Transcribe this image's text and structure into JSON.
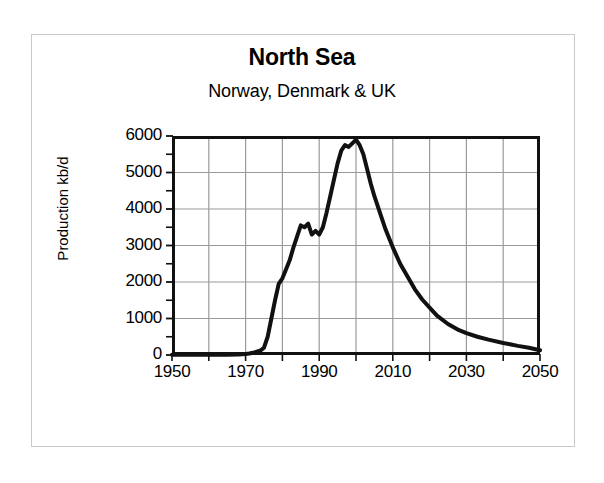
{
  "chart_data": {
    "type": "line",
    "title": "North Sea",
    "subtitle": "Norway, Denmark & UK",
    "xlabel": "",
    "ylabel": "Production kb/d",
    "xlim": [
      1950,
      2050
    ],
    "ylim": [
      0,
      6000
    ],
    "grid": true,
    "legend": null,
    "x_major_ticks": [
      1950,
      1970,
      1990,
      2010,
      2030,
      2050
    ],
    "x_major_tick_labels": [
      "1950",
      "1970",
      "1990",
      "2010",
      "2030",
      "2050"
    ],
    "x_minor_tick_step": 10,
    "y_ticks": [
      0,
      1000,
      2000,
      3000,
      4000,
      5000,
      6000
    ],
    "y_tick_labels": [
      "0",
      "1000",
      "2000",
      "3000",
      "4000",
      "5000",
      "6000"
    ],
    "y_minor_tick_step": 500,
    "line_color": "#111111",
    "grid_color": "#9a9a9a",
    "frame_color": "#111111",
    "series": [
      {
        "name": "North Sea production",
        "x": [
          1950,
          1955,
          1960,
          1965,
          1968,
          1970,
          1971,
          1972,
          1973,
          1974,
          1975,
          1976,
          1977,
          1978,
          1979,
          1980,
          1981,
          1982,
          1983,
          1984,
          1985,
          1986,
          1987,
          1988,
          1989,
          1990,
          1991,
          1992,
          1993,
          1994,
          1995,
          1996,
          1997,
          1998,
          1999,
          2000,
          2001,
          2002,
          2003,
          2004,
          2005,
          2006,
          2007,
          2008,
          2009,
          2010,
          2012,
          2014,
          2016,
          2018,
          2020,
          2022,
          2025,
          2028,
          2030,
          2033,
          2036,
          2040,
          2044,
          2047,
          2050
        ],
        "y": [
          5,
          5,
          8,
          10,
          15,
          30,
          40,
          60,
          90,
          120,
          200,
          500,
          1000,
          1500,
          1950,
          2100,
          2350,
          2600,
          2950,
          3250,
          3550,
          3500,
          3600,
          3300,
          3400,
          3300,
          3500,
          3900,
          4350,
          4800,
          5250,
          5600,
          5750,
          5700,
          5800,
          5900,
          5750,
          5500,
          5100,
          4700,
          4350,
          4050,
          3750,
          3450,
          3200,
          2950,
          2500,
          2150,
          1800,
          1520,
          1300,
          1080,
          850,
          680,
          600,
          500,
          420,
          330,
          250,
          200,
          130
        ]
      }
    ],
    "annotations": []
  }
}
